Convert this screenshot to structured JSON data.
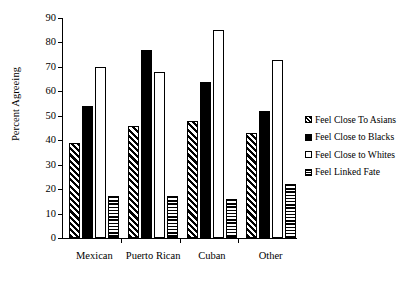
{
  "chart_data": {
    "type": "bar",
    "title": "",
    "xlabel": "",
    "ylabel": "Percent Agreeing",
    "ylim": [
      0,
      90
    ],
    "ytick_step": 10,
    "yticks": [
      0,
      10,
      20,
      30,
      40,
      50,
      60,
      70,
      80,
      90
    ],
    "grid": false,
    "legend_position": "right",
    "categories": [
      "Mexican",
      "Puerto Rican",
      "Cuban",
      "Other"
    ],
    "series": [
      {
        "name": "Feel Close To Asians",
        "pattern": "diagonal-hatch",
        "values": [
          39,
          46,
          48,
          43
        ]
      },
      {
        "name": "Feel Close to Blacks",
        "pattern": "solid-black",
        "values": [
          54,
          77,
          64,
          52
        ]
      },
      {
        "name": "Feel Close to Whites",
        "pattern": "open-white",
        "values": [
          70,
          68,
          85,
          73
        ]
      },
      {
        "name": "Feel Linked Fate",
        "pattern": "horizontal-hatch",
        "values": [
          17,
          17,
          16,
          22
        ]
      }
    ]
  }
}
